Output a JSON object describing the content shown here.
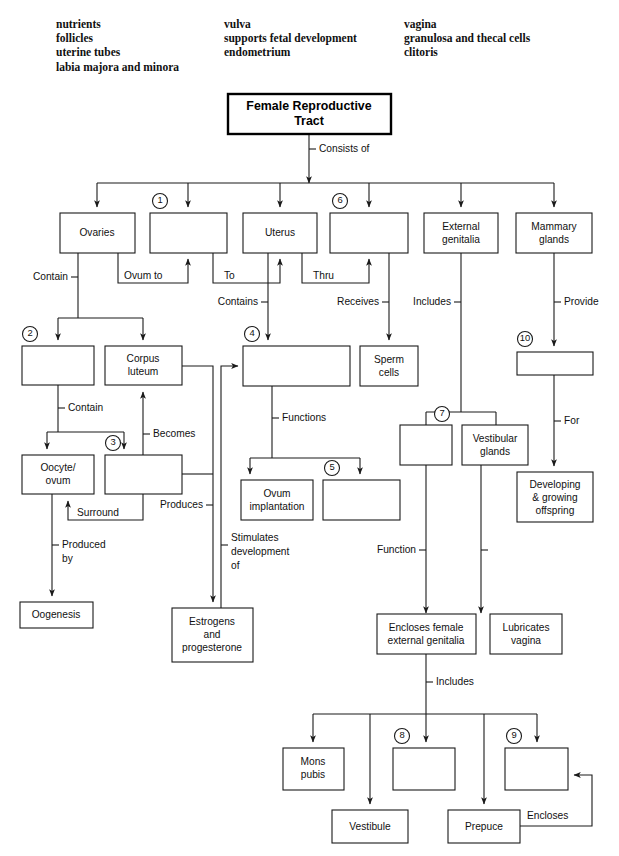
{
  "word_bank": {
    "columns": [
      [
        "nutrients",
        "follicles",
        "uterine tubes",
        "labia majora and minora"
      ],
      [
        "vulva",
        "supports fetal development",
        "endometrium"
      ],
      [
        "vagina",
        "granulosa and thecal cells",
        "clitoris"
      ]
    ]
  },
  "diagram": {
    "title": "Female Reproductive Tract",
    "boxes": {
      "root": "Female Reproductive Tract",
      "ovaries": "Ovaries",
      "blank1": "",
      "uterus": "Uterus",
      "blank6": "",
      "external_genitalia": "External genitalia",
      "mammary_glands": "Mammary glands",
      "blank2": "",
      "corpus_luteum": "Corpus luteum",
      "blank4": "",
      "sperm_cells": "Sperm cells",
      "blank10": "",
      "oocyte_ovum": "Oocyte/ ovum",
      "blank3": "",
      "ovum_implantation": "Ovum implantation",
      "blank5": "",
      "blank7": "",
      "vestibular_glands": "Vestibular glands",
      "developing_offspring": "Developing & growing offspring",
      "oogenesis": "Oogenesis",
      "estrogens": "Estrogens and progesterone",
      "encloses_female": "Encloses female external genitalia",
      "lubricates_vagina": "Lubricates vagina",
      "mons_pubis": "Mons pubis",
      "blank8": "",
      "blank9": "",
      "vestibule": "Vestibule",
      "prepuce": "Prepuce"
    },
    "box_numbers": {
      "n1": "1",
      "n2": "2",
      "n3": "3",
      "n4": "4",
      "n5": "5",
      "n6": "6",
      "n7": "7",
      "n8": "8",
      "n9": "9",
      "n10": "10"
    },
    "edge_labels": {
      "consists_of": "Consists of",
      "contain_a": "Contain",
      "ovum_to": "Ovum to",
      "to": "To",
      "thru": "Thru",
      "contains": "Contains",
      "receives": "Receives",
      "includes_top": "Includes",
      "provide": "Provide",
      "contain_b": "Contain",
      "becomes": "Becomes",
      "surround": "Surround",
      "produces": "Produces",
      "produced_by_1": "Produced",
      "produced_by_2": "by",
      "functions": "Functions",
      "stimulates_1": "Stimulates",
      "stimulates_2": "development",
      "stimulates_3": "of",
      "for": "For",
      "function": "Function",
      "includes_bottom": "Includes",
      "encloses": "Encloses"
    }
  },
  "colors": {
    "stroke": "#1a1a1a",
    "background": "#ffffff",
    "text": "#111111"
  }
}
